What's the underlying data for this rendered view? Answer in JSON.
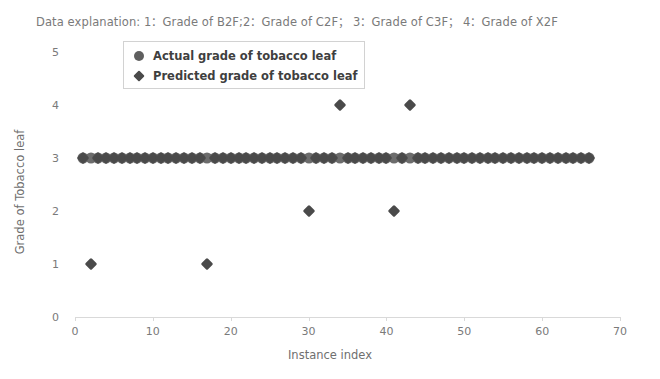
{
  "chart_data": {
    "type": "scatter",
    "title": "Data explanation: 1：Grade of B2F;2：Grade of C2F； 3：Grade of C3F； 4：Grade of X2F",
    "xlabel": "Instance index",
    "ylabel": "Grade of Tobacco leaf",
    "xlim": [
      0,
      70
    ],
    "ylim": [
      0,
      5
    ],
    "xticks": [
      0,
      10,
      20,
      30,
      40,
      50,
      60,
      70
    ],
    "yticks": [
      0,
      1,
      2,
      3,
      4,
      5
    ],
    "grid": false,
    "legend_position": "upper-left-inside",
    "legend": [
      {
        "name": "Actual grade of tobacco leaf",
        "marker": "circle",
        "color": "#5f5f5f"
      },
      {
        "name": "Predicted grade of tobacco leaf",
        "marker": "diamond",
        "color": "#4a4a4a"
      }
    ],
    "series": [
      {
        "name": "Actual grade of tobacco leaf",
        "marker": "circle",
        "color": "#5f5f5f",
        "x": [
          1,
          2,
          3,
          4,
          5,
          6,
          7,
          8,
          9,
          10,
          11,
          12,
          13,
          14,
          15,
          16,
          17,
          18,
          19,
          20,
          21,
          22,
          23,
          24,
          25,
          26,
          27,
          28,
          29,
          30,
          31,
          32,
          33,
          34,
          35,
          36,
          37,
          38,
          39,
          40,
          41,
          42,
          43,
          44,
          45,
          46,
          47,
          48,
          49,
          50,
          51,
          52,
          53,
          54,
          55,
          56,
          57,
          58,
          59,
          60,
          61,
          62,
          63,
          64,
          65,
          66
        ],
        "y": [
          3,
          3,
          3,
          3,
          3,
          3,
          3,
          3,
          3,
          3,
          3,
          3,
          3,
          3,
          3,
          3,
          3,
          3,
          3,
          3,
          3,
          3,
          3,
          3,
          3,
          3,
          3,
          3,
          3,
          3,
          3,
          3,
          3,
          3,
          3,
          3,
          3,
          3,
          3,
          3,
          3,
          3,
          3,
          3,
          3,
          3,
          3,
          3,
          3,
          3,
          3,
          3,
          3,
          3,
          3,
          3,
          3,
          3,
          3,
          3,
          3,
          3,
          3,
          3,
          3,
          3
        ]
      },
      {
        "name": "Predicted grade of tobacco leaf",
        "marker": "diamond",
        "color": "#4a4a4a",
        "x": [
          1,
          2,
          3,
          4,
          5,
          6,
          7,
          8,
          9,
          10,
          11,
          12,
          13,
          14,
          15,
          16,
          17,
          18,
          19,
          20,
          21,
          22,
          23,
          24,
          25,
          26,
          27,
          28,
          29,
          30,
          31,
          32,
          33,
          34,
          35,
          36,
          37,
          38,
          39,
          40,
          41,
          42,
          43,
          44,
          45,
          46,
          47,
          48,
          49,
          50,
          51,
          52,
          53,
          54,
          55,
          56,
          57,
          58,
          59,
          60,
          61,
          62,
          63,
          64,
          65,
          66
        ],
        "y": [
          3,
          1,
          3,
          3,
          3,
          3,
          3,
          3,
          3,
          3,
          3,
          3,
          3,
          3,
          3,
          3,
          1,
          3,
          3,
          3,
          3,
          3,
          3,
          3,
          3,
          3,
          3,
          3,
          3,
          2,
          3,
          3,
          3,
          4,
          3,
          3,
          3,
          3,
          3,
          3,
          2,
          3,
          4,
          3,
          3,
          3,
          3,
          3,
          3,
          3,
          3,
          3,
          3,
          3,
          3,
          3,
          3,
          3,
          3,
          3,
          3,
          3,
          3,
          3,
          3,
          3
        ]
      }
    ],
    "outliers": [
      {
        "x": 2,
        "y": 1,
        "series": "Predicted grade of tobacco leaf"
      },
      {
        "x": 17,
        "y": 1,
        "series": "Predicted grade of tobacco leaf"
      },
      {
        "x": 30,
        "y": 2,
        "series": "Predicted grade of tobacco leaf"
      },
      {
        "x": 41,
        "y": 2,
        "series": "Predicted grade of tobacco leaf"
      },
      {
        "x": 34,
        "y": 4,
        "series": "Predicted grade of tobacco leaf"
      },
      {
        "x": 43,
        "y": 4,
        "series": "Predicted grade of tobacco leaf"
      }
    ]
  }
}
